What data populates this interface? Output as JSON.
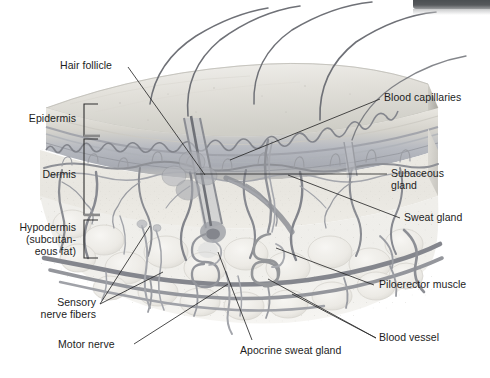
{
  "figure": {
    "type": "anatomical-illustration",
    "background_color": "#ffffff",
    "ink_color": "#1d1d1d"
  },
  "corner": {
    "bar_color": "#4b4f52",
    "name": "top-right-dark-bar"
  },
  "layer_brackets": [
    {
      "label": "Epidermis",
      "name": "epidermis"
    },
    {
      "label": "Dermis",
      "name": "dermis"
    },
    {
      "label_line1": "Hypodermis",
      "label_line2": "(subcutan-",
      "label_line3": "eous fat)",
      "name": "hypodermis"
    }
  ],
  "callouts": {
    "hair_follicle": "Hair follicle",
    "blood_capillaries": "Blood capillaries",
    "subaceous_gland_line1": "Subaceous",
    "subaceous_gland_line2": "gland",
    "sweat_gland": "Sweat gland",
    "piloerector_muscle": "Piloerector muscle",
    "blood_vessel": "Blood vessel",
    "apocrine_sweat_gland": "Apocrine sweat gland",
    "sensory_nerve_fibers_line1": "Sensory",
    "sensory_nerve_fibers_line2": "nerve fibers",
    "motor_nerve": "Motor nerve"
  },
  "palette": {
    "epidermis_top": "#d8d6cf",
    "epidermis_mid": "#b9bcc2",
    "dermis": "#e6e5e1",
    "hypodermis": "#eeeeea",
    "vessel": "#8d8f95",
    "vessel_dark": "#6e7076",
    "hair": "#6b6d72",
    "leader_line": "#2a2a2a"
  }
}
